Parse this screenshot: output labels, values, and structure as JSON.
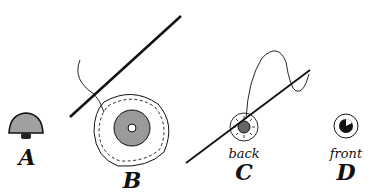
{
  "figure": {
    "panels": [
      {
        "id": "A",
        "label": "A",
        "caption": "",
        "description": "shank button, side view"
      },
      {
        "id": "B",
        "label": "B",
        "caption": "",
        "description": "button on fabric circle with running stitch, needle and thread"
      },
      {
        "id": "C",
        "label": "C",
        "caption": "back",
        "description": "back of button with needle through gathered fabric"
      },
      {
        "id": "D",
        "label": "D",
        "caption": "front",
        "description": "finished covered button, front"
      }
    ],
    "colors": {
      "ink": "#111111",
      "shade": "#9a9a9a",
      "background": "#ffffff"
    }
  }
}
